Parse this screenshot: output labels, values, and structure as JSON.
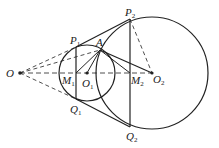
{
  "diagram": {
    "type": "geometry",
    "points": {
      "O": {
        "label": "O",
        "sub": ""
      },
      "O1": {
        "label": "O",
        "sub": "1"
      },
      "O2": {
        "label": "O",
        "sub": "2"
      },
      "P1": {
        "label": "P",
        "sub": "1"
      },
      "P2": {
        "label": "P",
        "sub": "2"
      },
      "Q1": {
        "label": "Q",
        "sub": "1"
      },
      "Q2": {
        "label": "Q",
        "sub": "2"
      },
      "M1": {
        "label": "M",
        "sub": "1"
      },
      "M2": {
        "label": "M",
        "sub": "2"
      },
      "A": {
        "label": "A",
        "sub": ""
      }
    },
    "colors": {
      "stroke": "#222222",
      "background": "#ffffff"
    }
  }
}
